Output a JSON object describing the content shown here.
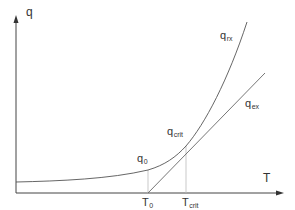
{
  "diagram": {
    "axes": {
      "y_label": "q",
      "x_label": "T"
    },
    "curves": {
      "reaction": {
        "base": "q",
        "sub": "rx"
      },
      "exchange": {
        "base": "q",
        "sub": "ex"
      }
    },
    "points": {
      "initial": {
        "base": "q",
        "sub": "0"
      },
      "critical": {
        "base": "q",
        "sub": "crit"
      }
    },
    "ticks": {
      "t0": {
        "base": "T",
        "sub": "0"
      },
      "tcrit": {
        "base": "T",
        "sub": "crit"
      }
    },
    "colors": {
      "axis": "#444444",
      "curve": "#555555",
      "guide": "#bbbbbb",
      "text": "#333333"
    }
  }
}
